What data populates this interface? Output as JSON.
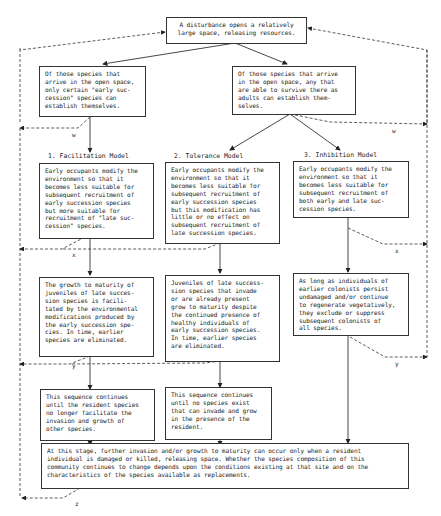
{
  "diagram": {
    "top": "A disturbance opens a relatively\nlarge space, releasing resources.",
    "branch_left": "Of those species that\narrive in the open space,\nonly certain \"early suc-\ncession\" species can\nestablish themselves.",
    "branch_right": "Of those species that arrive\nin the open space, any that\nare able to survive there as\nadults can establish them-\nselves.",
    "models": [
      {
        "title": "1. Facilitation Model",
        "step1": "Early occupants modify the\nenvironment so that it\nbecomes less suitable for\nsubsequent recruitment of\nearly succession species\nbut more suitable for\nrecruitment of \"late suc-\ncession\" species.",
        "step2": "The growth to maturity of\njuveniles of late succes-\nsion species is facili-\ntated by the environmental\nmodifications produced by\nthe early succession spe-\ncies.  In time, earlier\nspecies are eliminated.",
        "step3": "This sequence continues\nuntil the resident species\nno longer facilitate the\ninvasion and growth of\nother species."
      },
      {
        "title": "2. Tolerance Model",
        "step1": "Early occupants modify the\nenvironment so that it\nbecomes less suitable for\nsubsequent recruitment of\nearly succession species\nbut this modification has\nlittle or no effect on\nsubsequent recruitment of\nlate succession species.",
        "step2": "Juveniles of late success-\nsion species that invade\nor are already present\ngrow to maturity despite\nthe continued presence of\nhealthy individuals of\nearly succession species.\nIn time, earlier species\nare eliminated.",
        "step3": "This sequence continues\nuntil no species exist\nthat can invade and grow\nin the presence of the\nresident."
      },
      {
        "title": "3. Inhibition Model",
        "step1": "Early occupants modify the\nenvironment so that it\nbecomes less suitable for\nsubsequent recruitment of\nboth early and late suc-\ncession species.",
        "step2": "As long as individuals of\nearlier colonists persist\nundamaged and/or continue\nto regenerate vegetatively,\nthey exclude or suppress\nsubsequent colonists of\nall species."
      }
    ],
    "bottom": "At this stage, further invasion and/or growth to maturity can occur only when a resident\nindividual is damaged or killed, releasing space.  Whether the species composition of this\ncommunity continues to change depends upon the conditions existing at that site and on the\ncharacteristics of the species available as replacements.",
    "feedback_tags": {
      "w_left": "w",
      "w_right": "w",
      "x_left": "x",
      "x_right": "x",
      "y_left": "y",
      "y_right": "y",
      "z": "z"
    }
  }
}
